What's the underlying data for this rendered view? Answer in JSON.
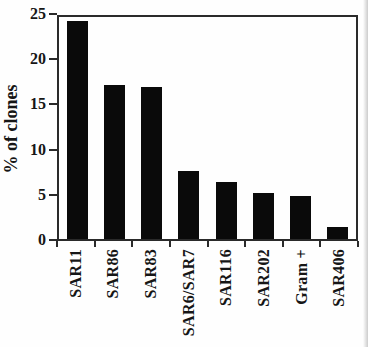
{
  "chart_data": {
    "type": "bar",
    "categories": [
      "SAR11",
      "SAR86",
      "SAR83",
      "SAR6/SAR7",
      "SAR116",
      "SAR202",
      "Gram +",
      "SAR406"
    ],
    "values": [
      24.5,
      17.3,
      17.1,
      7.7,
      6.4,
      5.2,
      4.9,
      1.4
    ],
    "title": "",
    "xlabel": "",
    "ylabel": "% of clones",
    "ylim": [
      0,
      25
    ],
    "yticks": [
      0,
      5,
      10,
      15,
      20,
      25
    ],
    "grid": false,
    "legend": false,
    "bar_color": "#0a0a0a",
    "axis_color": "#2a2a2a",
    "text_color": "#161616"
  }
}
